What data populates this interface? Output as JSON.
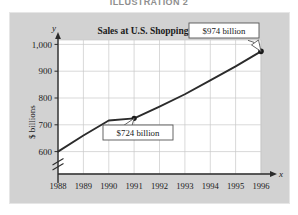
{
  "figure": {
    "illustration_caption": "ILLUSTRATION 2",
    "y_axis_title": "$ billions",
    "x_axis_symbol": "x",
    "y_axis_symbol": "y",
    "background_color": "#d2d2d2",
    "plot_background_color": "#ffffff",
    "line_color": "#2b2b2b",
    "grid_color": "#c8c8c8"
  },
  "chart_data": {
    "type": "line",
    "title": "Sales at U.S. Shopping Centers",
    "xlabel": "",
    "ylabel": "$ billions",
    "x": [
      1988,
      1989,
      1990,
      1991,
      1992,
      1993,
      1994,
      1995,
      1996
    ],
    "categories": [
      "1988",
      "1989",
      "1990",
      "1991",
      "1992",
      "1993",
      "1994",
      "1995",
      "1996"
    ],
    "values": [
      600,
      660,
      716,
      724,
      768,
      814,
      866,
      918,
      974
    ],
    "series": [
      {
        "name": "Sales",
        "values": [
          600,
          660,
          716,
          724,
          768,
          814,
          866,
          918,
          974
        ]
      }
    ],
    "ylim": [
      560,
      1040
    ],
    "yticks": [
      600,
      700,
      800,
      900,
      1000
    ],
    "ytick_labels": [
      "600",
      "700",
      "800",
      "900",
      "1,000"
    ],
    "xtick_labels": [
      "1988",
      "1989",
      "1990",
      "1991",
      "1992",
      "1993",
      "1994",
      "1995",
      "1996"
    ],
    "grid": true,
    "legend": "none",
    "axis_break": true,
    "markers": [
      {
        "x": 1991,
        "y": 724,
        "label": "$724 billion"
      },
      {
        "x": 1996,
        "y": 974,
        "label": "$974 billion"
      }
    ],
    "annotations": [
      {
        "text": "$724 billion",
        "points_to_x": 1991,
        "points_to_y": 724
      },
      {
        "text": "$974 billion",
        "points_to_x": 1996,
        "points_to_y": 974
      }
    ]
  }
}
